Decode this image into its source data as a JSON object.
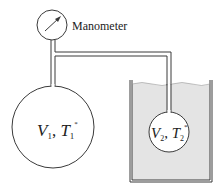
{
  "diagram": {
    "manometer_label": "Manometer",
    "vessel1": {
      "V": "V",
      "V_sub": "1",
      "T": "T",
      "T_sub": "1",
      "T_sup": "*"
    },
    "vessel2": {
      "V": "V",
      "V_sub": "2",
      "T": "T",
      "T_sub": "2",
      "T_sup": "*"
    },
    "colors": {
      "stroke": "#3a3a3a",
      "bath_fill": "#e4e4e4",
      "background": "#ffffff"
    }
  }
}
